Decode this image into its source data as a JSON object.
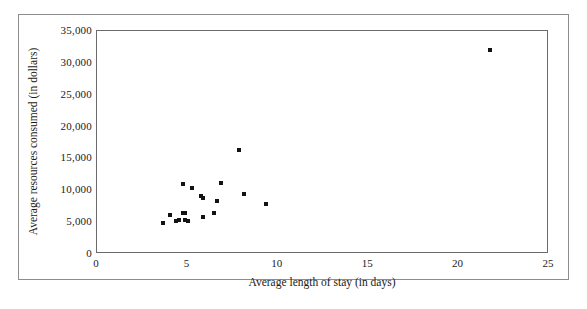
{
  "chart_data": {
    "type": "scatter",
    "title": "",
    "xlabel": "Average length of stay (in days)",
    "ylabel": "Average resources consumed (in dollars)",
    "xlim": [
      0,
      25
    ],
    "ylim": [
      0,
      35000
    ],
    "xticks": [
      "0",
      "5",
      "10",
      "15",
      "20",
      "25"
    ],
    "xtick_values": [
      0,
      5,
      10,
      15,
      20,
      25
    ],
    "yticks": [
      "0",
      "5,000",
      "10,000",
      "15,000",
      "20,000",
      "25,000",
      "30,000",
      "35,000"
    ],
    "ytick_values": [
      0,
      5000,
      10000,
      15000,
      20000,
      25000,
      30000,
      35000
    ],
    "grid": false,
    "legend": false,
    "marker_color": "#131313",
    "marker": "square",
    "points": [
      {
        "x": 3.7,
        "y": 4700
      },
      {
        "x": 4.1,
        "y": 5900
      },
      {
        "x": 4.4,
        "y": 5000
      },
      {
        "x": 4.6,
        "y": 5200
      },
      {
        "x": 4.8,
        "y": 6200
      },
      {
        "x": 4.9,
        "y": 6200
      },
      {
        "x": 4.9,
        "y": 5200
      },
      {
        "x": 5.1,
        "y": 5100
      },
      {
        "x": 4.8,
        "y": 10900
      },
      {
        "x": 5.3,
        "y": 10200
      },
      {
        "x": 5.8,
        "y": 8900
      },
      {
        "x": 5.9,
        "y": 8600
      },
      {
        "x": 5.9,
        "y": 5600
      },
      {
        "x": 6.5,
        "y": 6300
      },
      {
        "x": 6.7,
        "y": 8200
      },
      {
        "x": 6.9,
        "y": 11000
      },
      {
        "x": 7.9,
        "y": 16200
      },
      {
        "x": 8.2,
        "y": 9200
      },
      {
        "x": 9.4,
        "y": 7700
      },
      {
        "x": 21.8,
        "y": 31800
      }
    ]
  }
}
